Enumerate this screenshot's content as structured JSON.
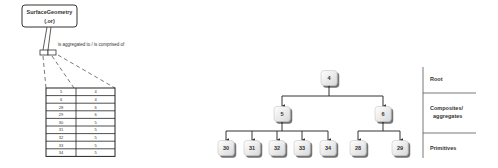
{
  "entity": {
    "name": "SurfaceGeometry",
    "subtitle": "(.or)",
    "relation_label": "is aggregated to / is comprised of"
  },
  "table": {
    "rows": [
      {
        "child": "5",
        "parent": "4"
      },
      {
        "child": "6",
        "parent": "4"
      },
      {
        "child": "28",
        "parent": "6"
      },
      {
        "child": "29",
        "parent": "6"
      },
      {
        "child": "30",
        "parent": "5"
      },
      {
        "child": "31",
        "parent": "5"
      },
      {
        "child": "32",
        "parent": "5"
      },
      {
        "child": "33",
        "parent": "5"
      },
      {
        "child": "34",
        "parent": "5"
      }
    ]
  },
  "tree": {
    "root": "4",
    "composites": [
      "5",
      "6"
    ],
    "primitives_of_5": [
      "30",
      "31",
      "32",
      "33",
      "34"
    ],
    "primitives_of_6": [
      "28",
      "29"
    ]
  },
  "levels": {
    "root": "Root",
    "composites_line1": "Composites/",
    "composites_line2": "aggregates",
    "primitives": "Primitives"
  }
}
